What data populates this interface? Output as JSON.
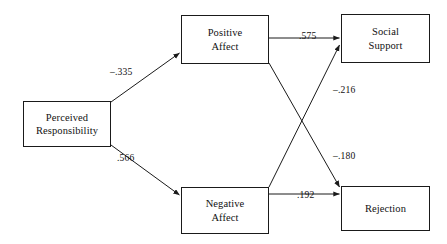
{
  "diagram": {
    "type": "path-diagram",
    "nodes": [
      {
        "id": "perceived_responsibility",
        "label": "Perceived\nResponsibility"
      },
      {
        "id": "positive_affect",
        "label": "Positive\nAffect"
      },
      {
        "id": "negative_affect",
        "label": "Negative\nAffect"
      },
      {
        "id": "social_support",
        "label": "Social\nSupport"
      },
      {
        "id": "rejection",
        "label": "Rejection"
      }
    ],
    "paths": [
      {
        "id": "pr_to_pa",
        "from": "perceived_responsibility",
        "to": "positive_affect",
        "coefficient": "–.335"
      },
      {
        "id": "pr_to_na",
        "from": "perceived_responsibility",
        "to": "negative_affect",
        "coefficient": ".566"
      },
      {
        "id": "pa_to_ss",
        "from": "positive_affect",
        "to": "social_support",
        "coefficient": ".575"
      },
      {
        "id": "na_to_ss",
        "from": "negative_affect",
        "to": "social_support",
        "coefficient": "–.216"
      },
      {
        "id": "pa_to_rj",
        "from": "positive_affect",
        "to": "rejection",
        "coefficient": "–.180"
      },
      {
        "id": "na_to_rj",
        "from": "negative_affect",
        "to": "rejection",
        "coefficient": ".192"
      }
    ],
    "colors": {
      "stroke": "#1a1a1a",
      "text": "#111111",
      "background": "#ffffff"
    }
  }
}
